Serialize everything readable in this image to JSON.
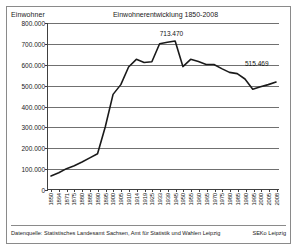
{
  "chart_data": {
    "type": "line",
    "title": "Einwohnerentwicklung 1850-2008",
    "ylabel": "Einwohner",
    "xlabel": "",
    "ylim": [
      0,
      800000
    ],
    "ytick_values": [
      0,
      100000,
      200000,
      300000,
      400000,
      500000,
      600000,
      700000,
      800000
    ],
    "ytick_labels": [
      "0",
      "100.000",
      "200.000",
      "300.000",
      "400.000",
      "500.000",
      "600.000",
      "700.000",
      "800.000"
    ],
    "grid": true,
    "legend": "none",
    "line_color": "#1a1a1a",
    "categories": [
      "1850",
      "1864",
      "1871",
      "1875",
      "1880",
      "1885",
      "1890",
      "1895",
      "1900",
      "1905",
      "1910",
      "1914",
      "1919",
      "1925",
      "1933",
      "1939",
      "1945",
      "1950",
      "1955",
      "1960",
      "1965",
      "1970",
      "1975",
      "1980",
      "1985",
      "1990",
      "1995",
      "2000",
      "2005",
      "2008"
    ],
    "values": [
      63000,
      78000,
      98000,
      112000,
      130000,
      150000,
      170000,
      300000,
      456000,
      503000,
      588000,
      625000,
      610000,
      613000,
      700000,
      707000,
      713470,
      590000,
      625000,
      614000,
      600000,
      600000,
      580000,
      562000,
      556000,
      530000,
      481000,
      493000,
      503000,
      515469
    ],
    "annotations": [
      {
        "label": "713.470",
        "at_category": "1945",
        "value": 713470
      },
      {
        "label": "515.469",
        "at_category": "2008",
        "value": 515469
      }
    ]
  },
  "footer": {
    "source": "Datenquelle: Statistisches Landesamt Sachsen, Amt für Statistik und Wahlen Leipzig",
    "credit": "SEKo Leipzig"
  }
}
